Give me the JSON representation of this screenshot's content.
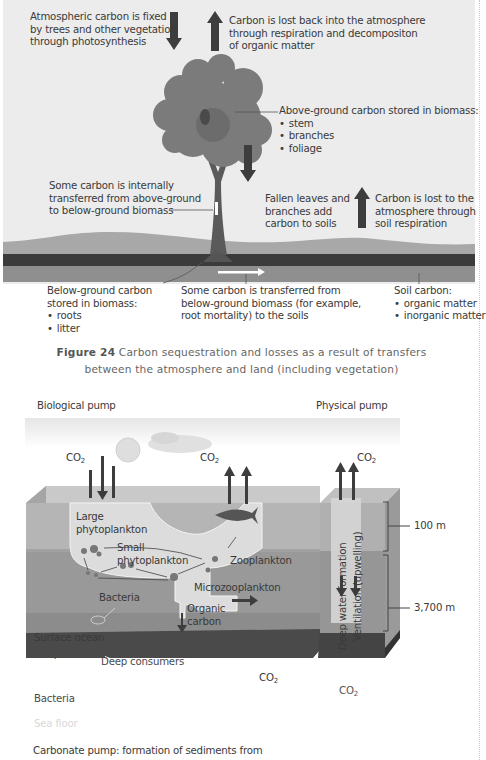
{
  "figure24": {
    "labels": {
      "fixed": [
        "Atmospheric carbon is fixed",
        "by trees and other vegetation",
        "through photosynthesis"
      ],
      "lost": [
        "Carbon is lost back into the atmosphere",
        "through respiration and decompositon",
        "of organic matter"
      ],
      "above_ground_title": "Above-ground carbon stored in biomass:",
      "above_ground_items": [
        "stem",
        "branches",
        "foliage"
      ],
      "internal": [
        "Some carbon is internally",
        "transferred from above-ground",
        "to below-ground biomass"
      ],
      "fallen": [
        "Fallen leaves and",
        "branches add",
        "carbon to soils"
      ],
      "soil_resp": [
        "Carbon is lost to the",
        "atmosphere through",
        "soil respiration"
      ],
      "below_ground_title": [
        "Below-ground carbon",
        "stored in biomass:"
      ],
      "below_ground_items": [
        "roots",
        "litter"
      ],
      "transfer": [
        "Some carbon is transferred from",
        "below-ground biomass (for example,",
        "root mortality) to the soils"
      ],
      "soil_carbon_title": "Soil carbon:",
      "soil_carbon_items": [
        "organic matter",
        "inorganic matter"
      ]
    },
    "caption": {
      "number": "Figure 24",
      "line1": " Carbon sequestration and losses as a result of transfers",
      "line2": "between the atmosphere and land (including vegetation)"
    },
    "colors": {
      "panel_bg": "#ececec",
      "tree": "#7b7b7b",
      "arrow": "#3d3d3d",
      "hill": "#a8a8a8",
      "soil_dark": "#3b3b3b",
      "soil_mid": "#8f8f8f"
    }
  },
  "ocean": {
    "biological_pump": "Biological pump",
    "physical_pump": "Physical pump",
    "co2": "CO",
    "co2_sub": "2",
    "labels": {
      "large_phyto": [
        "Large",
        "phytoplankton"
      ],
      "small_phyto": [
        "Small",
        "phytoplankton"
      ],
      "zooplankton": "Zooplankton",
      "microzooplankton": "Microzooplankton",
      "bacteria_upper": "Bacteria",
      "organic_carbon": [
        "Organic",
        "carbon"
      ],
      "surface_ocean": "Surface ocean",
      "deep_ocean": "Deep ocean",
      "deep_consumers": "Deep consumers",
      "bacteria_lower": "Bacteria",
      "sea_floor": "Sea floor",
      "deep_water": "Deep water formation",
      "ventilation": "Ventilation (upwelling)",
      "depth_100": "100 m",
      "depth_3700": "3,700 m"
    },
    "bottom_text": "Carbonate pump: formation of sediments from",
    "colors": {
      "surface": "#b5b5b5",
      "surface_top": "#c9c9c9",
      "deep": "#999999",
      "bacteria_layer": "#8c8c8c",
      "floor": "#4a4a4a",
      "plume": "#dcdcdc",
      "column": "#d6d6d6"
    }
  }
}
